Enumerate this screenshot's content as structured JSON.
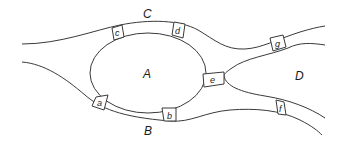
{
  "diagram": {
    "type": "map-graph",
    "land_masses": [
      {
        "id": "A",
        "label": "A"
      },
      {
        "id": "B",
        "label": "B"
      },
      {
        "id": "C",
        "label": "C"
      },
      {
        "id": "D",
        "label": "D"
      }
    ],
    "bridges": [
      {
        "id": "a",
        "label": "a",
        "connects": [
          "A",
          "B"
        ]
      },
      {
        "id": "b",
        "label": "b",
        "connects": [
          "A",
          "B"
        ]
      },
      {
        "id": "c",
        "label": "c",
        "connects": [
          "A",
          "C"
        ]
      },
      {
        "id": "d",
        "label": "d",
        "connects": [
          "A",
          "C"
        ]
      },
      {
        "id": "e",
        "label": "e",
        "connects": [
          "A",
          "D"
        ]
      },
      {
        "id": "f",
        "label": "f",
        "connects": [
          "B",
          "D"
        ]
      },
      {
        "id": "g",
        "label": "g",
        "connects": [
          "C",
          "D"
        ]
      }
    ],
    "colors": {
      "stroke": "#3a3a3a",
      "background": "#ffffff",
      "text": "#1a1a1a"
    }
  }
}
